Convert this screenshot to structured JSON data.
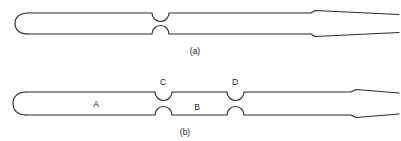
{
  "figure": {
    "background_color": "#ffffff",
    "line_color": "#2b2b2b",
    "text_color": "#1a1a1a"
  },
  "panels": [
    {
      "id": "a",
      "caption": "(a)",
      "caption_x": 195,
      "caption_y": 54,
      "description": "Capillary tube, rounded closed left end, single central constriction, stepped shoulder and tapered open right tip",
      "tube": {
        "left_end": "rounded-cap",
        "right_end": "tapered-tip",
        "top_y": 13,
        "bottom_y": 34,
        "left_x": 18,
        "right_x": 398
      },
      "constrictions": [
        {
          "name": "center-constriction",
          "x": 160,
          "label": ""
        }
      ],
      "regions": [],
      "shoulder_x": 312
    },
    {
      "id": "b",
      "caption": "(b)",
      "caption_x": 185,
      "caption_y": 135,
      "description": "Capillary tube, rounded closed left end, two constrictions C and D bounding region B, region A to the left of C, stepped shoulder and tapered open right tip",
      "tube": {
        "left_end": "rounded-cap",
        "right_end": "tapered-tip",
        "top_y": 92,
        "bottom_y": 115,
        "left_x": 16,
        "right_x": 398
      },
      "constrictions": [
        {
          "name": "constriction-c",
          "x": 163,
          "label": "C",
          "label_x": 163,
          "label_y": 85
        },
        {
          "name": "constriction-d",
          "x": 235,
          "label": "D",
          "label_x": 235,
          "label_y": 85
        }
      ],
      "regions": [
        {
          "name": "region-a",
          "label": "A",
          "label_x": 96,
          "label_y": 107
        },
        {
          "name": "region-b",
          "label": "B",
          "label_x": 197,
          "label_y": 110
        }
      ],
      "shoulder_x": 352
    }
  ]
}
